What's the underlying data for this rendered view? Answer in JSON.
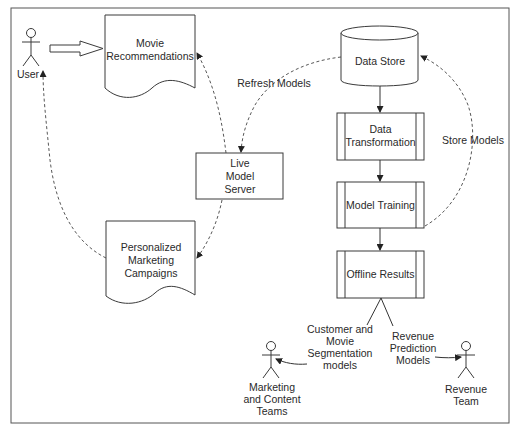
{
  "diagram": {
    "frame": {
      "border_color": "#555555",
      "background": "#ffffff"
    },
    "actors": [
      {
        "id": "user",
        "label": [
          "User"
        ]
      },
      {
        "id": "marketing",
        "label": [
          "Marketing",
          "and Content",
          "Teams"
        ]
      },
      {
        "id": "revenue",
        "label": [
          "Revenue",
          "Team"
        ]
      }
    ],
    "documents": [
      {
        "id": "movie_recs",
        "label": [
          "Movie",
          "Recommendations"
        ]
      },
      {
        "id": "personalized",
        "label": [
          "Personalized",
          "Marketing",
          "Campaigns"
        ]
      }
    ],
    "boxes": [
      {
        "id": "live_server",
        "label": [
          "Live",
          "Model",
          "Server"
        ]
      }
    ],
    "database": {
      "id": "data_store",
      "label": [
        "Data Store"
      ]
    },
    "processes": [
      {
        "id": "data_transformation",
        "label": [
          "Data",
          "Transformation"
        ]
      },
      {
        "id": "model_training",
        "label": [
          "Model Training"
        ]
      },
      {
        "id": "offline_results",
        "label": [
          "Offline Results"
        ]
      }
    ],
    "edge_labels": {
      "refresh_models": "Refresh Models",
      "store_models": "Store Models",
      "customer_segmentation": [
        "Customer and",
        "Movie",
        "Segmentation",
        "models"
      ],
      "revenue_prediction": [
        "Revenue",
        "Prediction",
        "Models"
      ]
    },
    "edges": [
      {
        "from": "user",
        "to": "movie_recs",
        "style": "block-arrow"
      },
      {
        "from": "data_store",
        "to": "data_transformation",
        "style": "solid"
      },
      {
        "from": "data_transformation",
        "to": "model_training",
        "style": "solid"
      },
      {
        "from": "model_training",
        "to": "offline_results",
        "style": "solid"
      },
      {
        "from": "model_training",
        "to": "data_store",
        "style": "dashed",
        "label": "Store Models"
      },
      {
        "from": "data_store",
        "to": "live_server",
        "style": "dashed",
        "label": "Refresh Models"
      },
      {
        "from": "live_server",
        "to": "movie_recs",
        "style": "dashed"
      },
      {
        "from": "live_server",
        "to": "personalized",
        "style": "dashed"
      },
      {
        "from": "personalized",
        "to": "user",
        "style": "dashed"
      },
      {
        "from": "offline_results",
        "to": "marketing",
        "style": "solid",
        "label": "Customer and Movie Segmentation models"
      },
      {
        "from": "offline_results",
        "to": "revenue",
        "style": "solid",
        "label": "Revenue Prediction Models"
      }
    ]
  }
}
